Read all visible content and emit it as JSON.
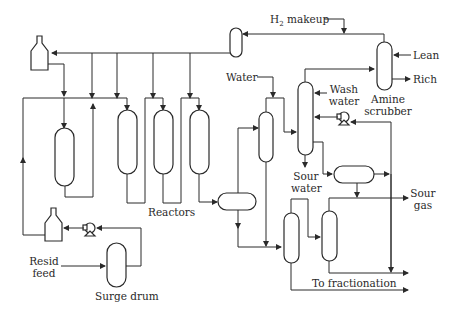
{
  "diagram": {
    "labels": {
      "h2_makeup_prefix": "H",
      "h2_makeup_sub": "2",
      "h2_makeup_suffix": " makeup",
      "lean": "Lean",
      "rich": "Rich",
      "amine_scrubber_1": "Amine",
      "amine_scrubber_2": "scrubber",
      "water": "Water",
      "wash_water_1": "Wash",
      "wash_water_2": "water",
      "sour_water_1": "Sour",
      "sour_water_2": "water",
      "sour_gas_1": "Sour",
      "sour_gas_2": "gas",
      "reactors": "Reactors",
      "resid_feed_1": "Resid",
      "resid_feed_2": "feed",
      "surge_drum": "Surge drum",
      "to_fractionation": "To fractionation"
    },
    "nodes": [
      {
        "id": "furnace-top",
        "type": "heater"
      },
      {
        "id": "furnace-bottom",
        "type": "heater"
      },
      {
        "id": "guard-reactor",
        "type": "vertical-vessel"
      },
      {
        "id": "reactor-1",
        "type": "vertical-vessel"
      },
      {
        "id": "reactor-2",
        "type": "vertical-vessel"
      },
      {
        "id": "reactor-3",
        "type": "vertical-vessel"
      },
      {
        "id": "recycle-compressor-drum",
        "type": "vertical-vessel"
      },
      {
        "id": "amine-scrubber",
        "type": "column"
      },
      {
        "id": "hot-separator",
        "type": "vertical-vessel"
      },
      {
        "id": "cold-separator",
        "type": "column"
      },
      {
        "id": "horizontal-drum-1",
        "type": "horizontal-drum"
      },
      {
        "id": "horizontal-drum-2",
        "type": "horizontal-drum"
      },
      {
        "id": "flash-drum-1",
        "type": "vertical-vessel"
      },
      {
        "id": "flash-drum-2",
        "type": "vertical-vessel"
      },
      {
        "id": "surge-drum",
        "type": "vertical-vessel"
      },
      {
        "id": "feed-pump",
        "type": "pump"
      },
      {
        "id": "wash-pump",
        "type": "pump"
      }
    ]
  }
}
